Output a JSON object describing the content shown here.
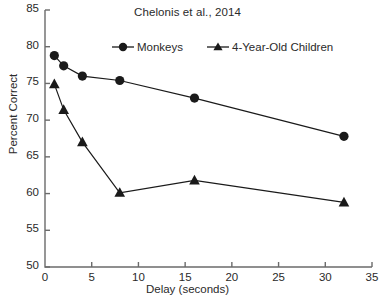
{
  "chart_data": {
    "type": "line",
    "title": "Chelonis et al., 2014",
    "xlabel": "Delay (seconds)",
    "ylabel": "Percent Correct",
    "x": [
      1,
      2,
      4,
      8,
      16,
      32
    ],
    "xlim": [
      0,
      35
    ],
    "ylim": [
      50,
      85
    ],
    "xticks": [
      0,
      5,
      10,
      15,
      20,
      25,
      30,
      35
    ],
    "yticks": [
      50,
      55,
      60,
      65,
      70,
      75,
      80,
      85
    ],
    "xtick_labels": [
      "0",
      "5",
      "10",
      "15",
      "20",
      "25",
      "30",
      "35"
    ],
    "ytick_labels": [
      "50",
      "55",
      "60",
      "65",
      "70",
      "75",
      "80",
      "85"
    ],
    "grid": false,
    "legend_position": "top-center",
    "series": [
      {
        "name": "Monkeys",
        "marker": "circle",
        "color": "#1a1a1a",
        "values": [
          78.8,
          77.4,
          76.0,
          75.4,
          73.0,
          67.8
        ]
      },
      {
        "name": "4-Year-Old Children",
        "marker": "triangle",
        "color": "#1a1a1a",
        "values": [
          74.9,
          71.4,
          67.0,
          60.1,
          61.8,
          58.8
        ]
      }
    ]
  },
  "legend": {
    "entries": [
      {
        "label": "Monkeys"
      },
      {
        "label": "4-Year-Old Children"
      }
    ]
  },
  "colors": {
    "axis": "#6b6b6b",
    "series": "#1a1a1a",
    "text": "#2a2a2a",
    "background": "#ffffff"
  }
}
